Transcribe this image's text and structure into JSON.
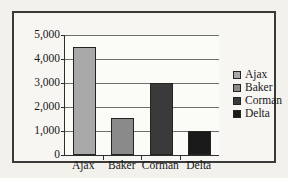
{
  "chart_data": {
    "type": "bar",
    "title": "",
    "xlabel": "",
    "ylabel": "",
    "categories": [
      "Ajax",
      "Baker",
      "Corman",
      "Delta"
    ],
    "values": [
      4500,
      1550,
      3000,
      1000
    ],
    "ylim": [
      0,
      5000
    ],
    "ytick_values": [
      5000,
      4000,
      3000,
      2000,
      1000,
      0
    ],
    "ytick_labels": [
      "5,000",
      "4,000",
      "3,000",
      "2,000",
      "1,000",
      "0"
    ],
    "grid": true,
    "legend_position": "right",
    "legend": [
      {
        "label": "Ajax",
        "color": "#a8a8a8"
      },
      {
        "label": "Baker",
        "color": "#8a8a8a"
      },
      {
        "label": "Corman",
        "color": "#3a3a3a"
      },
      {
        "label": "Delta",
        "color": "#1a1a1a"
      }
    ],
    "colors": [
      "#a8a8a8",
      "#8a8a8a",
      "#3a3a3a",
      "#1a1a1a"
    ]
  },
  "style": {
    "page_background": "#f2f1ec",
    "frame_border": "#3a3a38",
    "plot_background": "#fbfbf8",
    "axis_color": "#2e2e2c",
    "gridline_color": "#6d6d6a",
    "text_color": "#17171a"
  }
}
